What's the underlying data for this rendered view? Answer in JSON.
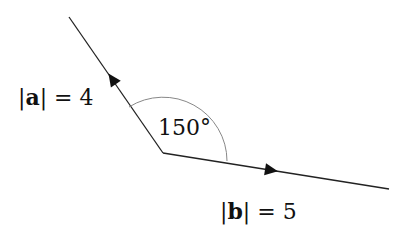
{
  "diagram": {
    "type": "vector-angle",
    "vertex": {
      "x": 163,
      "y": 153
    },
    "vector_a": {
      "name": "a",
      "magnitude": 4,
      "label_prefix": "|",
      "label_symbol": "a",
      "label_suffix": "| = 4",
      "end": {
        "x": 69,
        "y": 17
      }
    },
    "vector_b": {
      "name": "b",
      "magnitude": 5,
      "label_prefix": "|",
      "label_symbol": "b",
      "label_suffix": "| = 5",
      "end": {
        "x": 389,
        "y": 189
      }
    },
    "angle": {
      "value": 150,
      "label": "150°"
    },
    "colors": {
      "line": "#222222",
      "arc": "#888888",
      "text": "#111111"
    }
  }
}
